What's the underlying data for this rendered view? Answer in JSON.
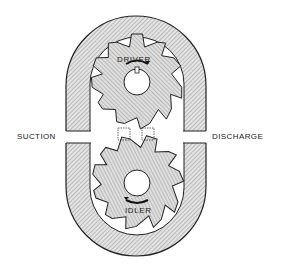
{
  "diagram": {
    "type": "external-gear-pump-cross-section",
    "labels": {
      "suction": "SUCTION",
      "discharge": "DISCHARGE",
      "driver": "DRIVER",
      "idler": "IDLER"
    },
    "gears": [
      {
        "name": "driver",
        "center": [
          137,
          82
        ],
        "teeth": 10,
        "rotation": "clockwise"
      },
      {
        "name": "idler",
        "center": [
          137,
          183
        ],
        "teeth": 10,
        "rotation": "counter-clockwise"
      }
    ],
    "colors": {
      "ink": "#222222",
      "hatch_light": "#e6e6e6",
      "hatch_dark": "#8a8a8a",
      "background": "#ffffff"
    }
  }
}
